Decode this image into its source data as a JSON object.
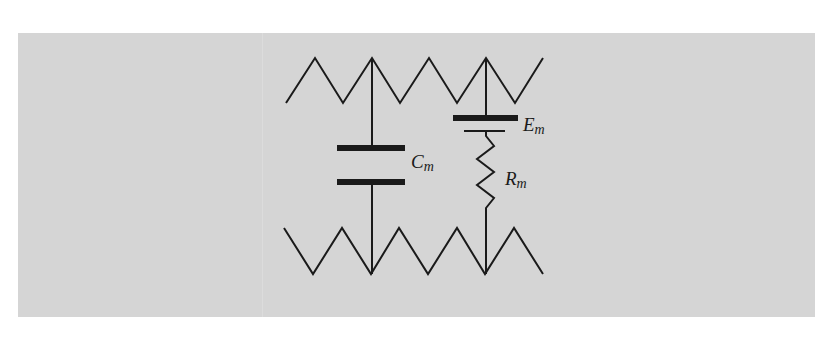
{
  "figure": {
    "type": "equivalent-circuit",
    "background_color": "#d5d5d5",
    "line_color": "#1a1a1a"
  },
  "components": {
    "capacitor": {
      "symbol": "C",
      "subscript": "m"
    },
    "battery": {
      "symbol": "E",
      "subscript": "m"
    },
    "resistor": {
      "symbol": "R",
      "subscript": "m"
    }
  }
}
